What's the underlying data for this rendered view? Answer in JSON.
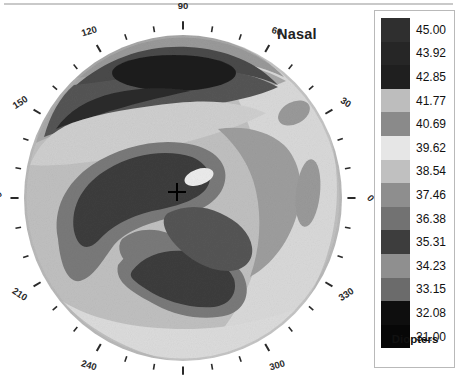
{
  "window": {
    "background": "#ffffff",
    "divider_color": "#c9c9c9"
  },
  "map": {
    "title": "Nasal",
    "center_marker": "crosshair-marker",
    "axis_labels": [
      {
        "deg": "90",
        "angle": 90
      },
      {
        "deg": "60",
        "angle": 60
      },
      {
        "deg": "30",
        "angle": 30
      },
      {
        "deg": "0",
        "angle": 0
      },
      {
        "deg": "330",
        "angle": 330
      },
      {
        "deg": "300",
        "angle": 300
      },
      {
        "deg": "270",
        "angle": 270
      },
      {
        "deg": "240",
        "angle": 240
      },
      {
        "deg": "210",
        "angle": 210
      },
      {
        "deg": "180",
        "angle": 180
      },
      {
        "deg": "150",
        "angle": 150
      },
      {
        "deg": "120",
        "angle": 120
      }
    ]
  },
  "scale": {
    "units_label": "Diopters",
    "min": "31.00",
    "max": "45.00",
    "steps": [
      {
        "value": "45.00",
        "color": "#2f2f2f"
      },
      {
        "value": "43.92",
        "color": "#262626"
      },
      {
        "value": "42.85",
        "color": "#1f1f1f"
      },
      {
        "value": "41.77",
        "color": "#bdbdbd"
      },
      {
        "value": "40.69",
        "color": "#8a8a8a"
      },
      {
        "value": "39.62",
        "color": "#e6e6e6"
      },
      {
        "value": "38.54",
        "color": "#c0c0c0"
      },
      {
        "value": "37.46",
        "color": "#8e8e8e"
      },
      {
        "value": "36.38",
        "color": "#727272"
      },
      {
        "value": "35.31",
        "color": "#3d3d3d"
      },
      {
        "value": "34.23",
        "color": "#8f8f8f"
      },
      {
        "value": "33.15",
        "color": "#6b6b6b"
      },
      {
        "value": "32.08",
        "color": "#0e0e0e"
      },
      {
        "value": "31.00",
        "color": "#070707"
      }
    ]
  },
  "chart_data": {
    "type": "heatmap",
    "title": "Nasal",
    "subtitle": "",
    "xlabel": "",
    "ylabel": "",
    "colorbar_label": "Diopters",
    "colorbar_ticks": [
      "45.00",
      "43.92",
      "42.85",
      "41.77",
      "40.69",
      "39.62",
      "38.54",
      "37.46",
      "36.38",
      "35.31",
      "34.23",
      "33.15",
      "32.08",
      "31.00"
    ],
    "value_range": [
      31.0,
      45.0
    ],
    "grid": false,
    "legend_position": "right",
    "projection": "polar-disc",
    "angular_ticks_deg": [
      0,
      10,
      20,
      30,
      40,
      50,
      60,
      70,
      80,
      90,
      100,
      110,
      120,
      130,
      140,
      150,
      160,
      170,
      180,
      190,
      200,
      210,
      220,
      230,
      240,
      250,
      260,
      270,
      280,
      290,
      300,
      310,
      320,
      330,
      340,
      350
    ],
    "angular_labeled_deg": [
      0,
      30,
      60,
      90,
      120,
      150,
      180,
      210,
      240,
      270,
      300,
      330
    ],
    "center_marker": {
      "label": "+",
      "x_deg": 0,
      "y_deg": 0
    },
    "regions": [
      {
        "name": "superior-steep-core",
        "approx_value": 42.9,
        "location_deg": 95,
        "radius_frac": 0.72
      },
      {
        "name": "superior-mid-band",
        "approx_value": 40.7,
        "location_deg": 110,
        "radius_frac": 0.8
      },
      {
        "name": "central-inferonasal-flat",
        "approx_value": 35.3,
        "location_deg": 185,
        "radius_frac": 0.38
      },
      {
        "name": "inferior-flat-lobe",
        "approx_value": 35.3,
        "location_deg": 250,
        "radius_frac": 0.5
      },
      {
        "name": "paracentral-temporal-flat",
        "approx_value": 37.5,
        "location_deg": 330,
        "radius_frac": 0.28
      },
      {
        "name": "peripheral-temporal-band",
        "approx_value": 38.5,
        "location_deg": 20,
        "radius_frac": 0.82
      },
      {
        "name": "central-bright-spot",
        "approx_value": 39.6,
        "location_deg": 55,
        "radius_frac": 0.14
      }
    ]
  }
}
